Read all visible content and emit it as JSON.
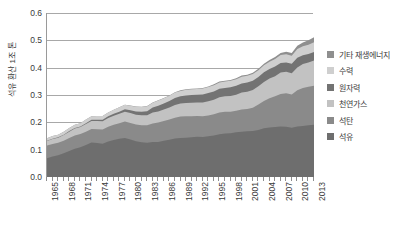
{
  "chart_data": {
    "type": "area",
    "stacked": true,
    "title": "",
    "xlabel": "",
    "ylabel": "석유 환산 1조 톤",
    "ylim": [
      0.0,
      0.6
    ],
    "ytick_labels": [
      "0.0",
      "0.1",
      "0.2",
      "0.3",
      "0.4",
      "0.5",
      "0.6"
    ],
    "ytick_values": [
      0.0,
      0.1,
      0.2,
      0.3,
      0.4,
      0.5,
      0.6
    ],
    "grid": true,
    "legend_position": "right",
    "legend_entries": [
      "기타 재생에너지",
      "수력",
      "원자력",
      "천연가스",
      "석탄",
      "석유"
    ],
    "x": [
      1965,
      1966,
      1967,
      1968,
      1969,
      1970,
      1971,
      1972,
      1973,
      1974,
      1975,
      1976,
      1977,
      1978,
      1979,
      1980,
      1981,
      1982,
      1983,
      1984,
      1985,
      1986,
      1987,
      1988,
      1989,
      1990,
      1991,
      1992,
      1993,
      1994,
      1995,
      1996,
      1997,
      1998,
      1999,
      2000,
      2001,
      2002,
      2003,
      2004,
      2005,
      2006,
      2007,
      2008,
      2009,
      2010,
      2011,
      2012,
      2013
    ],
    "xtick_labels": [
      "1965",
      "1968",
      "1971",
      "1974",
      "1977",
      "1980",
      "1983",
      "1986",
      "1989",
      "1992",
      "1995",
      "1998",
      "2001",
      "2004",
      "2007",
      "2010",
      "2013"
    ],
    "series": [
      {
        "name": "석유",
        "color": "#6e6e6e",
        "values": [
          0.069,
          0.075,
          0.08,
          0.087,
          0.095,
          0.103,
          0.109,
          0.117,
          0.126,
          0.124,
          0.122,
          0.13,
          0.135,
          0.14,
          0.143,
          0.137,
          0.131,
          0.127,
          0.125,
          0.128,
          0.128,
          0.133,
          0.136,
          0.141,
          0.143,
          0.144,
          0.145,
          0.147,
          0.146,
          0.149,
          0.152,
          0.156,
          0.159,
          0.16,
          0.164,
          0.166,
          0.167,
          0.168,
          0.172,
          0.178,
          0.181,
          0.183,
          0.185,
          0.184,
          0.18,
          0.185,
          0.187,
          0.189,
          0.191
        ]
      },
      {
        "name": "석탄",
        "color": "#8a8a8a",
        "values": [
          0.046,
          0.046,
          0.045,
          0.046,
          0.048,
          0.049,
          0.048,
          0.049,
          0.05,
          0.051,
          0.052,
          0.054,
          0.056,
          0.057,
          0.06,
          0.061,
          0.061,
          0.062,
          0.064,
          0.068,
          0.071,
          0.072,
          0.074,
          0.076,
          0.078,
          0.078,
          0.077,
          0.076,
          0.076,
          0.076,
          0.078,
          0.08,
          0.08,
          0.079,
          0.078,
          0.081,
          0.082,
          0.085,
          0.093,
          0.1,
          0.107,
          0.112,
          0.119,
          0.122,
          0.122,
          0.132,
          0.139,
          0.141,
          0.143
        ]
      },
      {
        "name": "천연가스",
        "color": "#c2c2c2",
        "values": [
          0.017,
          0.018,
          0.019,
          0.021,
          0.023,
          0.025,
          0.026,
          0.028,
          0.029,
          0.03,
          0.03,
          0.032,
          0.033,
          0.034,
          0.036,
          0.036,
          0.036,
          0.037,
          0.037,
          0.04,
          0.041,
          0.042,
          0.044,
          0.046,
          0.048,
          0.049,
          0.05,
          0.05,
          0.051,
          0.052,
          0.053,
          0.056,
          0.056,
          0.057,
          0.059,
          0.062,
          0.063,
          0.065,
          0.067,
          0.07,
          0.072,
          0.074,
          0.078,
          0.079,
          0.078,
          0.084,
          0.087,
          0.089,
          0.092
        ]
      },
      {
        "name": "원자력",
        "color": "#737373",
        "values": [
          0.001,
          0.001,
          0.001,
          0.001,
          0.002,
          0.002,
          0.002,
          0.003,
          0.004,
          0.004,
          0.005,
          0.006,
          0.007,
          0.008,
          0.009,
          0.01,
          0.012,
          0.013,
          0.015,
          0.018,
          0.021,
          0.022,
          0.024,
          0.026,
          0.026,
          0.027,
          0.028,
          0.028,
          0.029,
          0.03,
          0.03,
          0.031,
          0.031,
          0.032,
          0.033,
          0.033,
          0.034,
          0.034,
          0.034,
          0.035,
          0.035,
          0.035,
          0.035,
          0.034,
          0.034,
          0.035,
          0.032,
          0.031,
          0.031
        ]
      },
      {
        "name": "수력",
        "color": "#cfcfcf",
        "values": [
          0.009,
          0.01,
          0.01,
          0.011,
          0.011,
          0.012,
          0.012,
          0.013,
          0.013,
          0.014,
          0.014,
          0.014,
          0.015,
          0.016,
          0.016,
          0.017,
          0.017,
          0.017,
          0.018,
          0.018,
          0.019,
          0.019,
          0.019,
          0.02,
          0.02,
          0.021,
          0.021,
          0.021,
          0.022,
          0.022,
          0.023,
          0.023,
          0.023,
          0.024,
          0.024,
          0.025,
          0.024,
          0.025,
          0.025,
          0.026,
          0.027,
          0.028,
          0.029,
          0.03,
          0.03,
          0.032,
          0.033,
          0.034,
          0.036
        ]
      },
      {
        "name": "기타 재생에너지",
        "color": "#8f8f8f",
        "values": [
          0.0,
          0.0,
          0.0,
          0.0,
          0.0,
          0.0,
          0.0,
          0.0,
          0.0,
          0.0,
          0.0,
          0.0,
          0.0,
          0.0,
          0.0,
          0.001,
          0.001,
          0.001,
          0.001,
          0.001,
          0.001,
          0.001,
          0.001,
          0.001,
          0.002,
          0.002,
          0.002,
          0.002,
          0.002,
          0.002,
          0.003,
          0.003,
          0.003,
          0.003,
          0.003,
          0.004,
          0.004,
          0.004,
          0.005,
          0.005,
          0.006,
          0.007,
          0.008,
          0.009,
          0.01,
          0.012,
          0.014,
          0.016,
          0.018
        ]
      }
    ]
  }
}
